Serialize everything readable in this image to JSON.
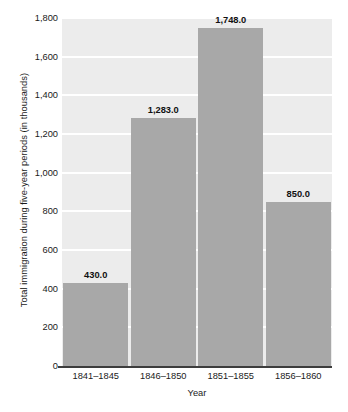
{
  "chart_data": {
    "type": "bar",
    "title": "",
    "subtitle": "",
    "xlabel": "Year",
    "ylabel": "Total immigration during five-year periods (in thousands)",
    "categories": [
      "1841–1845",
      "1846–1850",
      "1851–1855",
      "1856–1860"
    ],
    "values": [
      430.0,
      1283.0,
      1748.0,
      850.0
    ],
    "value_labels": [
      "430.0",
      "1,283.0",
      "1,748.0",
      "850.0"
    ],
    "ylim": [
      0,
      1800
    ],
    "yticks": [
      0,
      200,
      400,
      600,
      800,
      1000,
      1200,
      1400,
      1600,
      1800
    ],
    "ytick_labels": [
      "0",
      "200",
      "400",
      "600",
      "800",
      "1,000",
      "1,200",
      "1,400",
      "1,600",
      "1,800"
    ],
    "grid": true,
    "grid_axis": "y",
    "legend": false,
    "legend_position": "none",
    "bar_color": "#a8a8a8",
    "plot_background": "#ececec",
    "gridline_color": "#ffffff",
    "axis_line_color": "#3d3d3d",
    "text_color": "#1a1a1a"
  }
}
